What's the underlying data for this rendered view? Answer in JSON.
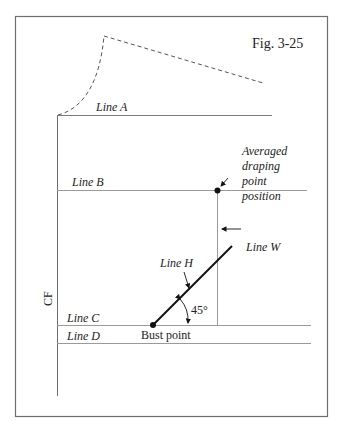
{
  "figure": {
    "title": "Fig. 3-25",
    "colors": {
      "frame": "#6e6e6e",
      "line": "#8a8a8a",
      "ink": "#111111",
      "dash": "#555555"
    }
  },
  "labels": {
    "line_a": "Line A",
    "line_b": "Line B",
    "line_c": "Line C",
    "line_d": "Line D",
    "line_h": "Line H",
    "line_w": "Line W",
    "cf": "CF",
    "angle": "45°",
    "bust_point": "Bust point",
    "draping_1": "Averaged",
    "draping_2": "draping",
    "draping_3": "point",
    "draping_4": "position"
  }
}
